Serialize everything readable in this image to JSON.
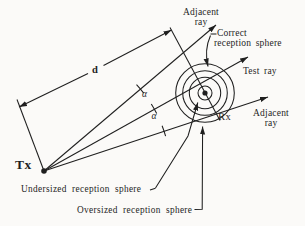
{
  "figure": {
    "type": "reception-sphere-ray-tracing-diagram",
    "colors": {
      "ink": "#1f1f1f",
      "background": "#fbfaf8"
    },
    "labels": {
      "tx": "Tx",
      "rx": "Rx",
      "distance": "d",
      "alpha": "α",
      "adjacent_ray_top": {
        "line1": "Adjacent",
        "line2": "ray"
      },
      "adjacent_ray_right": {
        "line1": "Adjacent",
        "line2": "ray"
      },
      "test_ray": "Test ray",
      "correct_sphere": {
        "line1": "Correct",
        "line2": "reception sphere"
      },
      "undersized_sphere": "Undersized reception sphere",
      "oversized_sphere": "Oversized reception sphere"
    }
  }
}
